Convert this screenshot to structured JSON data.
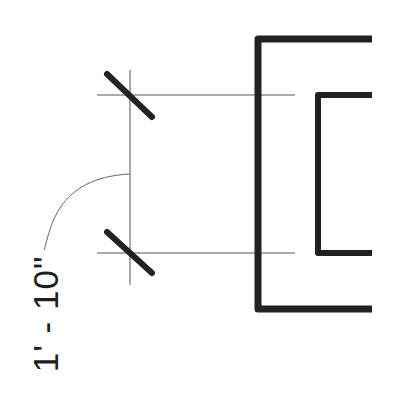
{
  "drawing": {
    "dimension_label": "1' - 10\"",
    "colors": {
      "thin_line": "#555555",
      "thick_line": "#222222",
      "background": "#ffffff"
    }
  }
}
